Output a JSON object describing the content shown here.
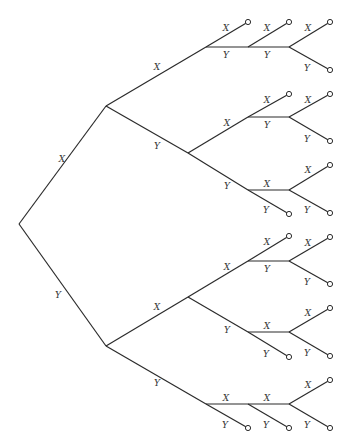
{
  "diagram": {
    "type": "binary-tree",
    "orientation": "left-to-right",
    "colors": {
      "line": "#2b2b2b",
      "label": "#333333",
      "background": "#ffffff"
    },
    "nodes": {
      "root": [
        19,
        224
      ],
      "A": [
        106,
        106
      ],
      "B": [
        106,
        346
      ],
      "AX": [
        206,
        47
      ],
      "AXY": [
        248,
        47
      ],
      "AXYY": [
        289,
        47
      ],
      "AY": [
        188,
        153
      ],
      "AYX": [
        248,
        117
      ],
      "AYXY": [
        289,
        117
      ],
      "AYY": [
        248,
        190
      ],
      "AYYX": [
        289,
        190
      ],
      "BX": [
        188,
        297
      ],
      "BXX": [
        248,
        261
      ],
      "BXXY": [
        289,
        261
      ],
      "BXY": [
        248,
        332
      ],
      "BXYX": [
        289,
        332
      ],
      "BY": [
        206,
        404
      ],
      "BYX": [
        248,
        404
      ],
      "BYXX": [
        289,
        404
      ]
    },
    "edges": [
      {
        "from": [
          19,
          224
        ],
        "to": [
          106,
          106
        ],
        "label": "X",
        "lx": 62,
        "ly": 162
      },
      {
        "from": [
          19,
          224
        ],
        "to": [
          106,
          346
        ],
        "label": "Y",
        "lx": 58,
        "ly": 298
      },
      {
        "from": [
          106,
          106
        ],
        "to": [
          206,
          47
        ],
        "label": "X",
        "lx": 157,
        "ly": 70
      },
      {
        "from": [
          106,
          106
        ],
        "to": [
          188,
          153
        ],
        "label": "Y",
        "lx": 157,
        "ly": 149
      },
      {
        "from": [
          206,
          47
        ],
        "to": [
          248,
          22
        ],
        "label": "X",
        "lx": 226,
        "ly": 31,
        "leaf": true
      },
      {
        "from": [
          206,
          47
        ],
        "to": [
          248,
          47
        ],
        "label": "Y",
        "lx": 226,
        "ly": 58
      },
      {
        "from": [
          248,
          47
        ],
        "to": [
          289,
          22
        ],
        "label": "X",
        "lx": 267,
        "ly": 31,
        "leaf": true
      },
      {
        "from": [
          248,
          47
        ],
        "to": [
          289,
          47
        ],
        "label": "Y",
        "lx": 267,
        "ly": 58
      },
      {
        "from": [
          289,
          47
        ],
        "to": [
          330,
          22
        ],
        "label": "X",
        "lx": 308,
        "ly": 31,
        "leaf": true
      },
      {
        "from": [
          289,
          47
        ],
        "to": [
          330,
          70
        ],
        "label": "Y",
        "lx": 307,
        "ly": 71,
        "leaf": true
      },
      {
        "from": [
          188,
          153
        ],
        "to": [
          248,
          117
        ],
        "label": "X",
        "lx": 227,
        "ly": 126
      },
      {
        "from": [
          188,
          153
        ],
        "to": [
          248,
          190
        ],
        "label": "Y",
        "lx": 227,
        "ly": 189
      },
      {
        "from": [
          248,
          117
        ],
        "to": [
          289,
          94
        ],
        "label": "X",
        "lx": 267,
        "ly": 103,
        "leaf": true
      },
      {
        "from": [
          248,
          117
        ],
        "to": [
          289,
          117
        ],
        "label": "Y",
        "lx": 267,
        "ly": 128
      },
      {
        "from": [
          289,
          117
        ],
        "to": [
          330,
          94
        ],
        "label": "X",
        "lx": 308,
        "ly": 103,
        "leaf": true
      },
      {
        "from": [
          289,
          117
        ],
        "to": [
          330,
          141
        ],
        "label": "Y",
        "lx": 307,
        "ly": 142,
        "leaf": true
      },
      {
        "from": [
          248,
          190
        ],
        "to": [
          289,
          190
        ],
        "label": "X",
        "lx": 267,
        "ly": 187
      },
      {
        "from": [
          248,
          190
        ],
        "to": [
          289,
          214
        ],
        "label": "Y",
        "lx": 266,
        "ly": 213,
        "leaf": true
      },
      {
        "from": [
          289,
          190
        ],
        "to": [
          330,
          165
        ],
        "label": "X",
        "lx": 308,
        "ly": 173,
        "leaf": true
      },
      {
        "from": [
          289,
          190
        ],
        "to": [
          330,
          213
        ],
        "label": "Y",
        "lx": 307,
        "ly": 213,
        "leaf": true
      },
      {
        "from": [
          106,
          346
        ],
        "to": [
          188,
          297
        ],
        "label": "X",
        "lx": 157,
        "ly": 310
      },
      {
        "from": [
          106,
          346
        ],
        "to": [
          206,
          404
        ],
        "label": "Y",
        "lx": 157,
        "ly": 386
      },
      {
        "from": [
          188,
          297
        ],
        "to": [
          248,
          261
        ],
        "label": "X",
        "lx": 227,
        "ly": 270
      },
      {
        "from": [
          188,
          297
        ],
        "to": [
          248,
          332
        ],
        "label": "Y",
        "lx": 227,
        "ly": 333
      },
      {
        "from": [
          248,
          261
        ],
        "to": [
          289,
          236
        ],
        "label": "X",
        "lx": 267,
        "ly": 245,
        "leaf": true
      },
      {
        "from": [
          248,
          261
        ],
        "to": [
          289,
          261
        ],
        "label": "Y",
        "lx": 267,
        "ly": 272
      },
      {
        "from": [
          289,
          261
        ],
        "to": [
          330,
          237
        ],
        "label": "X",
        "lx": 308,
        "ly": 246,
        "leaf": true
      },
      {
        "from": [
          289,
          261
        ],
        "to": [
          330,
          284
        ],
        "label": "Y",
        "lx": 307,
        "ly": 285,
        "leaf": true
      },
      {
        "from": [
          248,
          332
        ],
        "to": [
          289,
          332
        ],
        "label": "X",
        "lx": 267,
        "ly": 329
      },
      {
        "from": [
          248,
          332
        ],
        "to": [
          289,
          357
        ],
        "label": "Y",
        "lx": 266,
        "ly": 357,
        "leaf": true
      },
      {
        "from": [
          289,
          332
        ],
        "to": [
          330,
          308
        ],
        "label": "X",
        "lx": 308,
        "ly": 316,
        "leaf": true
      },
      {
        "from": [
          289,
          332
        ],
        "to": [
          330,
          356
        ],
        "label": "Y",
        "lx": 307,
        "ly": 356,
        "leaf": true
      },
      {
        "from": [
          206,
          404
        ],
        "to": [
          248,
          404
        ],
        "label": "X",
        "lx": 226,
        "ly": 401
      },
      {
        "from": [
          206,
          404
        ],
        "to": [
          248,
          428
        ],
        "label": "Y",
        "lx": 225,
        "ly": 428,
        "leaf": true
      },
      {
        "from": [
          248,
          404
        ],
        "to": [
          289,
          404
        ],
        "label": "X",
        "lx": 267,
        "ly": 401
      },
      {
        "from": [
          248,
          404
        ],
        "to": [
          289,
          428
        ],
        "label": "Y",
        "lx": 266,
        "ly": 428,
        "leaf": true
      },
      {
        "from": [
          289,
          404
        ],
        "to": [
          330,
          380
        ],
        "label": "X",
        "lx": 308,
        "ly": 388,
        "leaf": true
      },
      {
        "from": [
          289,
          404
        ],
        "to": [
          330,
          428
        ],
        "label": "Y",
        "lx": 307,
        "ly": 428,
        "leaf": true
      }
    ]
  }
}
